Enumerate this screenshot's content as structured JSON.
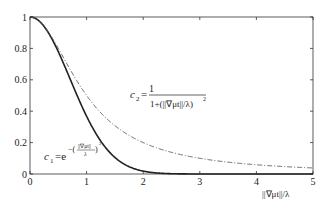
{
  "chart_data": {
    "type": "line",
    "title": "",
    "xlabel": "||∇μt||/λ",
    "ylabel": "",
    "xlim": [
      0,
      5
    ],
    "ylim": [
      0,
      1
    ],
    "grid": false,
    "legend": "none (inline curve labels)",
    "x_ticks": [
      "0",
      "1",
      "2",
      "3",
      "4",
      "5"
    ],
    "y_ticks": [
      "0",
      "0.2",
      "0.4",
      "0.6",
      "0.8",
      "1"
    ],
    "series": [
      {
        "name": "c1",
        "label": "c1 = e^{-(||∇μt||/λ)^2}",
        "style": "solid",
        "color": "#222222",
        "x": [
          0,
          0.25,
          0.5,
          0.75,
          1.0,
          1.25,
          1.5,
          1.75,
          2.0,
          2.25,
          2.5,
          3,
          4,
          5
        ],
        "values": [
          1.0,
          0.94,
          0.78,
          0.57,
          0.37,
          0.21,
          0.105,
          0.047,
          0.018,
          0.006,
          0.002,
          0.0,
          0.0,
          0.0
        ]
      },
      {
        "name": "c2",
        "label": "c2 = 1 / (1 + (||∇μt||/λ)^2)",
        "style": "dash-dot",
        "color": "#555555",
        "x": [
          0,
          0.25,
          0.5,
          0.75,
          1.0,
          1.5,
          2.0,
          2.5,
          3.0,
          3.5,
          4.0,
          4.5,
          5.0
        ],
        "values": [
          1.0,
          0.94,
          0.8,
          0.64,
          0.5,
          0.31,
          0.2,
          0.14,
          0.1,
          0.075,
          0.059,
          0.047,
          0.038
        ]
      }
    ]
  },
  "labels": {
    "c1_lhs": "c",
    "c1_sub": "1",
    "c1_eq": "=e",
    "c1_exp_num": "||∇μt||",
    "c1_exp_den": "λ",
    "c2_lhs": "c",
    "c2_sub": "2",
    "c2_eq": "=",
    "c2_num": "1",
    "c2_den": "1+(||∇μt||/λ)",
    "sq": "2",
    "xaxis": "||∇μt||/λ"
  }
}
